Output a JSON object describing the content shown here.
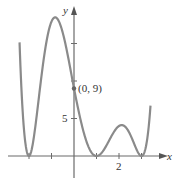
{
  "chart_data": {
    "type": "line",
    "title": "",
    "xlabel": "x",
    "ylabel": "y",
    "x_ticks": [
      -2,
      -1,
      0,
      1,
      2,
      3
    ],
    "x_tick_labels": [
      {
        "value": 2,
        "label": "2"
      }
    ],
    "y_ticks": [
      5,
      10,
      15
    ],
    "y_tick_labels": [
      {
        "value": 5,
        "label": "5"
      }
    ],
    "annotations": [
      {
        "x": 0,
        "y": 9,
        "label": "(0, 9)"
      }
    ],
    "series": [
      {
        "name": "f(x)",
        "description": "Even-degree polynomial touching x-axis at x=-2, x=1, x=3; y-intercept 9",
        "roots": [
          -2,
          1,
          3
        ],
        "key_points": [
          {
            "x": -2,
            "y": 0
          },
          {
            "x": -1.3,
            "y": 16.5
          },
          {
            "x": 0,
            "y": 9
          },
          {
            "x": 1,
            "y": 0
          },
          {
            "x": 2.05,
            "y": 4
          },
          {
            "x": 3,
            "y": 0
          }
        ]
      }
    ],
    "xlim": [
      -2.4,
      3.4
    ],
    "ylim": [
      -3,
      20
    ],
    "grid": false,
    "legend": null
  },
  "labels": {
    "x_axis": "x",
    "y_axis": "y",
    "point": "(0, 9)",
    "y_tick_5": "5",
    "x_tick_2": "2"
  }
}
